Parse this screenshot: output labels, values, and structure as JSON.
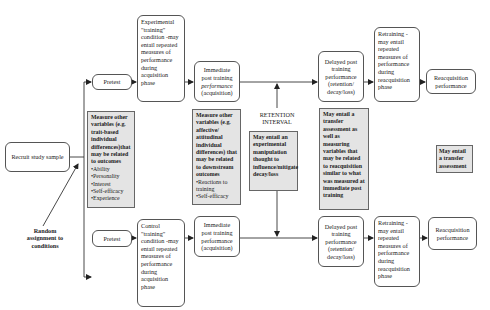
{
  "diagram": {
    "start": {
      "recruit": "Recruit study sample",
      "random_assignment": "Random assignment to conditions"
    },
    "experimental_path": {
      "pretest": "Pretest",
      "condition": "Experimental \"training\" condition -may entail repeated measures of performance during acquisition phase",
      "immediate_pre": "Immediate post training ",
      "immediate_em": "performance",
      "immediate_post": " (acquisition)",
      "delayed": "Delayed post training performance (retention/ decay/loss)",
      "retraining": "Retraining -may entail repeated measures of performance during reacquisition phase",
      "reacquisition": "Reacquisition performance"
    },
    "control_path": {
      "pretest": "Pretest",
      "condition": "Control \"training\" condition -may entail repeated measures of performance during acquisition phase",
      "immediate": "Immediate post training performance (acquisition)",
      "delayed": "Delayed post training performance (retention/ decay/loss)",
      "retraining": "Retraining -may entail repeated measures of performance during reacquisition phase",
      "reacquisition": "Reacquisition performance"
    },
    "notes": {
      "pretest_measures": {
        "text": "Measure other variables (e.g. trait-based individual differences)that may be related to outcomes",
        "items": [
          "Ability",
          "Personality",
          "Interest",
          "Self-efficacy",
          "Experience"
        ]
      },
      "posttest_measures": {
        "text": "Measure other variables (e.g. affective/ attitudinal individual differences) that may be related to downstream outcomes",
        "items": [
          "Reactions to training",
          "Self-efficacy"
        ]
      },
      "retention_interval_label": "RETENTION INTERVAL",
      "retention_manipulation": "May entail an experimental manipulation thought to influence/mitigate decay/loss",
      "delayed_transfer": "May entail a transfer assessment as well as measuring variables that may be related to reacquisition similar to what was measured at immediate post training",
      "reacq_transfer": "May entail a transfer assessment"
    }
  }
}
